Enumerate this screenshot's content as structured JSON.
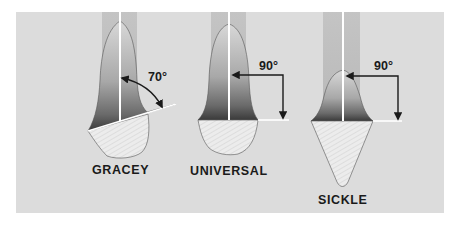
{
  "figure": {
    "background_color": "#dcdcdc",
    "page_color": "#ffffff",
    "instruments": [
      {
        "name": "GRACEY",
        "angle_label": "70°",
        "angle_degrees": 70,
        "blade_shape": "offset, rounded toe"
      },
      {
        "name": "UNIVERSAL",
        "angle_label": "90°",
        "angle_degrees": 90,
        "blade_shape": "rounded toe"
      },
      {
        "name": "SICKLE",
        "angle_label": "90°",
        "angle_degrees": 90,
        "blade_shape": "pointed tip"
      }
    ]
  }
}
